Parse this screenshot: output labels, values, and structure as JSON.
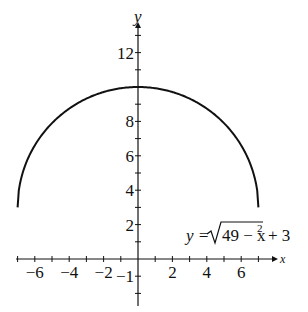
{
  "chart_data": {
    "type": "line",
    "title": "",
    "xlabel": "x",
    "ylabel": "y",
    "xlim": [
      -7.5,
      7.5
    ],
    "ylim": [
      -3,
      13
    ],
    "x_tick_labels": [
      "-6",
      "-4",
      "-2",
      "2",
      "4",
      "6"
    ],
    "y_tick_labels": [
      "-1",
      "2",
      "4",
      "6",
      "8",
      "12"
    ],
    "grid": false,
    "series": [
      {
        "name": "y = sqrt(49 - x^2) + 3",
        "function": "sqrt(49 - x^2) + 3",
        "domain": [
          -7,
          7
        ],
        "x": [
          -7,
          -6,
          -5,
          -4,
          -3,
          -2,
          -1,
          0,
          1,
          2,
          3,
          4,
          5,
          6,
          7
        ],
        "values": [
          3,
          6.61,
          7.9,
          8.74,
          9.32,
          9.71,
          9.93,
          10,
          9.93,
          9.71,
          9.32,
          8.74,
          7.9,
          6.61,
          3
        ]
      }
    ],
    "annotations": [
      {
        "text": "y = √(49 − x²) + 3",
        "position": "lower right"
      }
    ]
  },
  "labels": {
    "x_axis": "x",
    "y_axis": "y",
    "x_ticks": [
      {
        "v": -6,
        "t": "−6"
      },
      {
        "v": -4,
        "t": "−4"
      },
      {
        "v": -2,
        "t": "−2"
      },
      {
        "v": 2,
        "t": "2"
      },
      {
        "v": 4,
        "t": "4"
      },
      {
        "v": 6,
        "t": "6"
      }
    ],
    "y_ticks": [
      {
        "v": 12,
        "t": "12"
      },
      {
        "v": 8,
        "t": "8"
      },
      {
        "v": 6,
        "t": "6"
      },
      {
        "v": 4,
        "t": "4"
      },
      {
        "v": 2,
        "t": "2"
      },
      {
        "v": -1,
        "t": "−1"
      }
    ],
    "equation_lhs": "y = ",
    "equation_radicand": "49 − x",
    "equation_exp": "2",
    "equation_rhs": "+ 3"
  }
}
